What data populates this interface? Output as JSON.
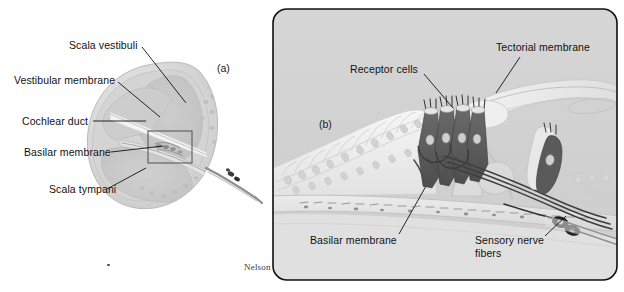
{
  "figure": {
    "credit": "Nelson",
    "background_color": "#ffffff"
  },
  "panel_a": {
    "letter": "(a)",
    "description": "Cross-section through one turn of the cochlea",
    "labels": [
      {
        "id": "scala-vestibuli",
        "text": "Scala vestibuli"
      },
      {
        "id": "vestibular-membrane",
        "text": "Vestibular membrane"
      },
      {
        "id": "cochlear-duct",
        "text": "Cochlear duct"
      },
      {
        "id": "basilar-membrane",
        "text": "Basilar membrane"
      },
      {
        "id": "scala-tympani",
        "text": "Scala tympani"
      }
    ],
    "colors": {
      "tissue_outer": "#d8d8d8",
      "tissue_inner": "#c9c9c9",
      "duct_fill": "#cfcfcf",
      "leader_line": "#1a1a1a",
      "inset_box": "#5a5a5a"
    }
  },
  "panel_b": {
    "letter": "(b)",
    "description": "Magnified view of the organ of Corti",
    "labels": [
      {
        "id": "receptor-cells",
        "text": "Receptor cells"
      },
      {
        "id": "tectorial-membrane",
        "text": "Tectorial membrane"
      },
      {
        "id": "basilar-membrane",
        "text": "Basilar membrane"
      },
      {
        "id": "sensory-nerve-fibers-line1",
        "text": "Sensory nerve"
      },
      {
        "id": "sensory-nerve-fibers-line2",
        "text": "fibers"
      }
    ],
    "colors": {
      "panel_background": "#d2d2d2",
      "panel_border": "#101010",
      "epithelium": "#f2f2f2",
      "hair_cell": "#585858",
      "nerve_fiber": "#4a4a4a",
      "tectorial": "#e8e8e8",
      "leader_line": "#111111"
    }
  }
}
